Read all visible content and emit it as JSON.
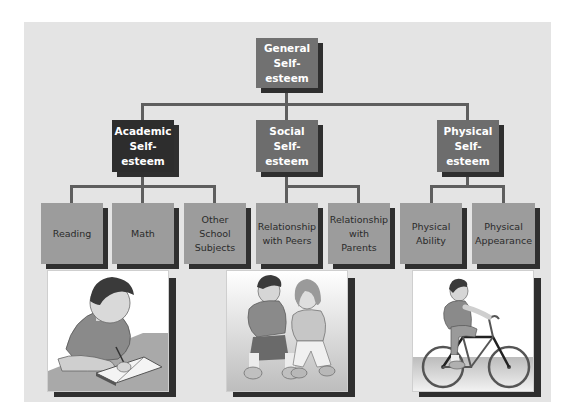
{
  "diagram": {
    "root": {
      "label": "General\nSelf-\nesteem"
    },
    "categories": [
      {
        "label": "Academic\nSelf-\nesteem",
        "children": [
          {
            "label": "Reading"
          },
          {
            "label": "Math"
          },
          {
            "label": "Other\nSchool\nSubjects"
          }
        ],
        "illustration": "boy-writing-in-notebook"
      },
      {
        "label": "Social\nSelf-\nesteem",
        "children": [
          {
            "label": "Relationship\nwith Peers"
          },
          {
            "label": "Relationship\nwith\nParents"
          }
        ],
        "illustration": "two-children-sitting-talking"
      },
      {
        "label": "Physical\nSelf-\nesteem",
        "children": [
          {
            "label": "Physical\nAbility"
          },
          {
            "label": "Physical\nAppearance"
          }
        ],
        "illustration": "boy-riding-bicycle"
      }
    ]
  },
  "colors": {
    "backdrop": "#e4e4e4",
    "connector": "#5e5e5e",
    "root_box": "#717171",
    "academic_box": "#2d2d2d",
    "social_physical_box": "#6d6d6d",
    "leaf_box": "#9c9c9c",
    "shadow": "#2f2f2f"
  }
}
